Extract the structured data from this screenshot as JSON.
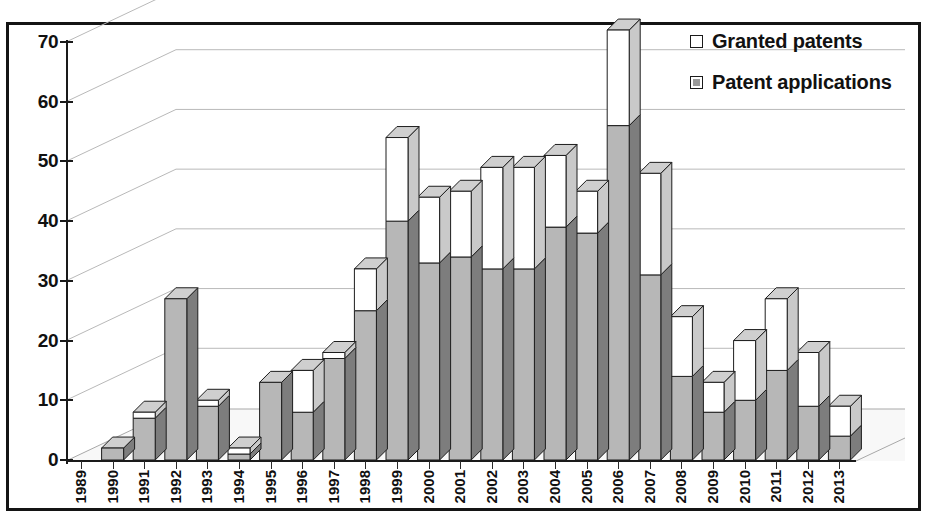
{
  "chart_data": {
    "type": "bar",
    "subtype": "stacked-column-3d",
    "title": "",
    "xlabel": "",
    "ylabel": "",
    "ylim": [
      0,
      75
    ],
    "yticks": [
      0,
      10,
      20,
      30,
      40,
      50,
      60,
      70
    ],
    "ytick_labels": [
      "0",
      "10",
      "20",
      "30",
      "40",
      "50",
      "60",
      "70"
    ],
    "grid": true,
    "legend_position": "top-right",
    "categories": [
      "1989",
      "1990",
      "1991",
      "1992",
      "1993",
      "1994",
      "1995",
      "1996",
      "1997",
      "1998",
      "1999",
      "2000",
      "2001",
      "2002",
      "2003",
      "2004",
      "2005",
      "2006",
      "2007",
      "2008",
      "2009",
      "2010",
      "2011",
      "2012",
      "2013"
    ],
    "series": [
      {
        "name": "Patent applications",
        "color": "#b7b7b7",
        "values": [
          0,
          2,
          7,
          27,
          9,
          1,
          13,
          8,
          17,
          25,
          40,
          33,
          34,
          32,
          32,
          39,
          38,
          56,
          31,
          14,
          8,
          10,
          15,
          9,
          4
        ]
      },
      {
        "name": "Granted patents",
        "color": "#ffffff",
        "values": [
          0,
          0,
          1,
          0,
          1,
          1,
          0,
          7,
          1,
          7,
          14,
          11,
          11,
          17,
          17,
          12,
          7,
          16,
          17,
          10,
          5,
          10,
          12,
          9,
          5
        ]
      }
    ],
    "totals": [
      0,
      2,
      8,
      27,
      10,
      2,
      13,
      15,
      18,
      32,
      54,
      44,
      45,
      49,
      49,
      51,
      45,
      72,
      48,
      24,
      13,
      20,
      27,
      18,
      9
    ]
  },
  "legend": {
    "items": [
      {
        "label": "Granted patents",
        "marker": "empty-square"
      },
      {
        "label": "Patent applications",
        "marker": "filled-square"
      }
    ]
  },
  "colors": {
    "granted_face": "#ffffff",
    "applications_face": "#b7b7b7",
    "granted_side": "#c9c9c9",
    "applications_side": "#7d7d7d",
    "top_face": "#cfcfcf",
    "outline": "#1d1d1d",
    "axis": "#1a1a1a",
    "gridline": "#b9b9b9",
    "frame": "#141414",
    "background": "#ffffff"
  }
}
